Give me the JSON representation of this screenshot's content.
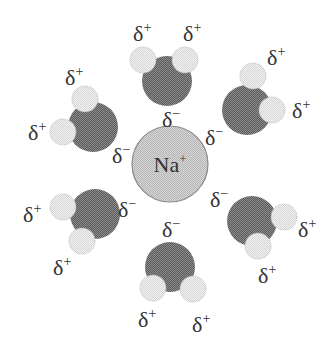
{
  "diagram": {
    "colors": {
      "background": "#ffffff",
      "oxygen": "#6e6e6e",
      "hydrogen": "#e6e6e6",
      "hydrogen_edge": "#bdbdbd",
      "ion": "#cbcbcb",
      "ion_edge": "#8a8a8a",
      "text": "#333333"
    },
    "ion": {
      "label": "Na",
      "charge": "+",
      "cx": 170,
      "cy": 164,
      "r": 38
    },
    "partial_negative": "δ−",
    "partial_positive": "δ+",
    "molecules": [
      {
        "name": "top",
        "O": [
          167,
          81
        ],
        "H": [
          [
            143,
            60
          ],
          [
            185,
            60
          ]
        ],
        "neg_label": [
          162,
          127
        ],
        "pos_labels": [
          [
            133,
            41
          ],
          [
            183,
            41
          ]
        ]
      },
      {
        "name": "upper-right",
        "O": [
          247,
          110
        ],
        "H": [
          [
            253,
            76
          ],
          [
            272,
            110
          ]
        ],
        "neg_label": [
          205,
          145
        ],
        "pos_labels": [
          [
            267,
            65
          ],
          [
            292,
            118
          ]
        ]
      },
      {
        "name": "lower-right",
        "O": [
          252,
          221
        ],
        "H": [
          [
            284,
            217
          ],
          [
            258,
            246
          ]
        ],
        "neg_label": [
          210,
          207
        ],
        "pos_labels": [
          [
            298,
            237
          ],
          [
            258,
            283
          ]
        ]
      },
      {
        "name": "bottom",
        "O": [
          170,
          267
        ],
        "H": [
          [
            153,
            288
          ],
          [
            193,
            289
          ]
        ],
        "neg_label": [
          162,
          237
        ],
        "pos_labels": [
          [
            138,
            327
          ],
          [
            192,
            332
          ]
        ]
      },
      {
        "name": "lower-left",
        "O": [
          95,
          214
        ],
        "H": [
          [
            63,
            207
          ],
          [
            82,
            241
          ]
        ],
        "neg_label": [
          118,
          217
        ],
        "pos_labels": [
          [
            23,
            222
          ],
          [
            53,
            275
          ]
        ]
      },
      {
        "name": "upper-left",
        "O": [
          93,
          127
        ],
        "H": [
          [
            85,
            99
          ],
          [
            63,
            132
          ]
        ],
        "neg_label": [
          112,
          163
        ],
        "pos_labels": [
          [
            65,
            85
          ],
          [
            28,
            140
          ]
        ]
      }
    ]
  }
}
